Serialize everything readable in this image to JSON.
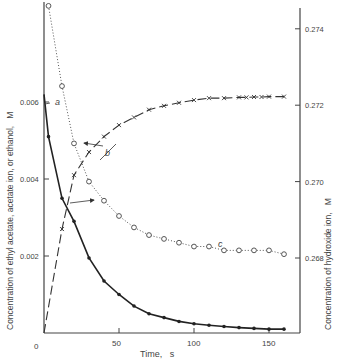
{
  "chart_data": {
    "type": "line",
    "title": "",
    "xlabel": "Time,   s",
    "ylabel_left": "Concentration of ethyl acetate, acetate ion, or ethanol,   M",
    "ylabel_right": "Concentration of hydroxide ion,   M",
    "xlim": [
      0,
      170
    ],
    "ylim_left": [
      0,
      0.0072
    ],
    "ylim_right": [
      0.2593,
      0.2752
    ],
    "x_ticks": [
      50,
      100,
      150
    ],
    "x_tick_labels": [
      "50",
      "100",
      "150"
    ],
    "origin_label": "0",
    "y_left_ticks": [
      0.002,
      0.004,
      0.006
    ],
    "y_left_tick_labels": [
      "0.002",
      "0.004",
      "0.006"
    ],
    "y_right_ticks": [
      0.268,
      0.27,
      0.272,
      0.274
    ],
    "y_right_tick_labels": [
      "0.268",
      "0.270",
      "0.272",
      "0.274"
    ],
    "grid": false,
    "legend": "none; curves labeled a, b, c with arrows",
    "series": [
      {
        "name": "a",
        "description": "ethyl acetate (left axis)",
        "style": "solid line, filled dot markers",
        "axis": "left",
        "x": [
          0,
          3,
          12,
          20,
          30,
          40,
          50,
          60,
          70,
          80,
          90,
          100,
          110,
          120,
          130,
          140,
          150,
          160
        ],
        "values": [
          0.0062,
          0.0051,
          0.0035,
          0.0029,
          0.00195,
          0.00135,
          0.001,
          0.0007,
          0.0005,
          0.0004,
          0.0003,
          0.00024,
          0.0002,
          0.00017,
          0.00014,
          0.00012,
          0.0001,
          0.0001
        ]
      },
      {
        "name": "b",
        "description": "acetate ion or ethanol (left axis)",
        "style": "dashed line, x markers",
        "axis": "left",
        "x": [
          0,
          12,
          20,
          30,
          40,
          50,
          60,
          70,
          80,
          90,
          100,
          110,
          120,
          130,
          135,
          140,
          145,
          150,
          160
        ],
        "values": [
          0,
          0.0027,
          0.0041,
          0.0047,
          0.0051,
          0.0054,
          0.0056,
          0.0058,
          0.0059,
          0.00598,
          0.00605,
          0.0061,
          0.0061,
          0.00612,
          0.00612,
          0.00613,
          0.00613,
          0.00614,
          0.00614
        ]
      },
      {
        "name": "c",
        "description": "hydroxide ion (right axis)",
        "style": "dotted line, open circle markers",
        "axis": "right",
        "x": [
          3,
          12,
          20,
          30,
          40,
          50,
          60,
          70,
          80,
          90,
          100,
          110,
          120,
          130,
          140,
          150,
          160
        ],
        "values": [
          0.2746,
          0.2725,
          0.271,
          0.27,
          0.2695,
          0.2691,
          0.2688,
          0.2686,
          0.2685,
          0.2684,
          0.2683,
          0.2683,
          0.2682,
          0.2682,
          0.2682,
          0.2682,
          0.2681
        ]
      }
    ],
    "annotations": [
      {
        "text": "a",
        "near": "solid decay curve, top left"
      },
      {
        "text": "b",
        "near": "dashed rising curve, arrows pointing to left and right axes"
      },
      {
        "text": "c",
        "near": "dotted curve, lower right"
      }
    ]
  }
}
